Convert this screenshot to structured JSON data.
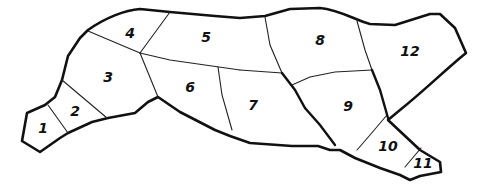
{
  "diagram": {
    "colors": {
      "stroke": "#111111",
      "background": "#ffffff"
    },
    "regions": [
      {
        "id": 1,
        "label": "1",
        "x": 43,
        "y": 128
      },
      {
        "id": 2,
        "label": "2",
        "x": 75,
        "y": 111
      },
      {
        "id": 3,
        "label": "3",
        "x": 108,
        "y": 77
      },
      {
        "id": 4,
        "label": "4",
        "x": 130,
        "y": 33
      },
      {
        "id": 5,
        "label": "5",
        "x": 206,
        "y": 37
      },
      {
        "id": 6,
        "label": "6",
        "x": 190,
        "y": 87
      },
      {
        "id": 7,
        "label": "7",
        "x": 253,
        "y": 105
      },
      {
        "id": 8,
        "label": "8",
        "x": 320,
        "y": 40
      },
      {
        "id": 9,
        "label": "9",
        "x": 348,
        "y": 106
      },
      {
        "id": 10,
        "label": "10",
        "x": 388,
        "y": 146
      },
      {
        "id": 11,
        "label": "11",
        "x": 423,
        "y": 163
      },
      {
        "id": 12,
        "label": "12",
        "x": 410,
        "y": 51
      }
    ]
  }
}
